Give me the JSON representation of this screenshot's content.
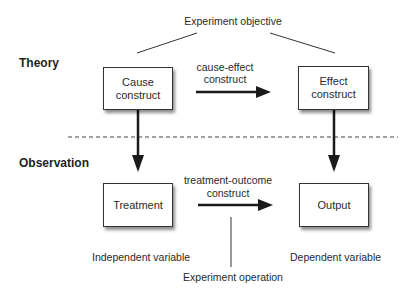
{
  "diagram": {
    "title": "Experiment objective",
    "sections": {
      "theory": "Theory",
      "observation": "Observation"
    },
    "boxes": {
      "cause": {
        "line1": "Cause",
        "line2": "construct"
      },
      "effect": {
        "line1": "Effect",
        "line2": "construct"
      },
      "treatment": {
        "line1": "Treatment"
      },
      "output": {
        "line1": "Output"
      }
    },
    "arrows": {
      "cause_effect": {
        "line1": "cause-effect",
        "line2": "construct"
      },
      "treatment_outcome": {
        "line1": "treatment-outcome",
        "line2": "construct"
      }
    },
    "annotations": {
      "independent": "Independent variable",
      "dependent": "Dependent variable",
      "operation": "Experiment operation"
    },
    "colors": {
      "stroke": "#1a1a1a",
      "text": "#2a2a2a",
      "background": "#ffffff"
    }
  }
}
